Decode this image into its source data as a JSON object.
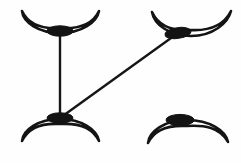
{
  "figure": {
    "canvas": {
      "width": 241,
      "height": 163
    },
    "background_color": "#fefefe",
    "outline_color": "#141414",
    "node_color": "#131313",
    "edge_color": "#161616",
    "outline_stroke_width": 2.6,
    "edge_stroke_width": 2.4
  },
  "shapes": [
    {
      "id": "top-left",
      "label": "crescent-top-left",
      "orientation": "opening-up",
      "bounds": {
        "x": 20,
        "y": 9,
        "width": 80,
        "height": 28
      },
      "path": "M 22 11 C 23 22 38 33 60 33 C 82 33 97 22 99 11 C 92 26 76 29 60 28 C 44 29 29 26 22 11 Z",
      "node": {
        "cx": 60,
        "cy": 31,
        "rx": 13,
        "ry": 5.2,
        "rotate": 0
      }
    },
    {
      "id": "top-right",
      "label": "crescent-top-right",
      "orientation": "opening-up",
      "bounds": {
        "x": 150,
        "y": 9,
        "width": 82,
        "height": 30
      },
      "path": "M 152 12 C 154 24 169 36 191 36 C 213 36 228 23 231 11 C 223 27 207 31 190 30 C 173 31 159 27 152 12 Z",
      "node": {
        "cx": 178,
        "cy": 33,
        "rx": 13,
        "ry": 5.4,
        "rotate": -8
      }
    },
    {
      "id": "bottom-left",
      "label": "crescent-bottom-left",
      "orientation": "opening-down",
      "bounds": {
        "x": 20,
        "y": 112,
        "width": 80,
        "height": 31
      },
      "path": "M 22 141 C 23 130 38 119 60 119 C 82 119 97 130 99 141 C 92 126 76 123 60 124 C 44 123 29 126 22 141 Z",
      "node": {
        "cx": 60,
        "cy": 118,
        "rx": 13,
        "ry": 5.2,
        "rotate": 0
      }
    },
    {
      "id": "bottom-right",
      "label": "crescent-bottom-right",
      "orientation": "opening-down",
      "bounds": {
        "x": 146,
        "y": 113,
        "width": 84,
        "height": 32
      },
      "path": "M 148 143 C 149 132 164 120 187 120 C 210 120 226 131 228 142 C 220 127 204 125 187 126 C 170 125 155 128 148 143 Z",
      "node": {
        "cx": 180,
        "cy": 120,
        "rx": 14,
        "ry": 5.6,
        "rotate": 0
      }
    }
  ],
  "edges": [
    {
      "id": "edge-vertical",
      "label": "edge-top-left-to-bottom-left",
      "from": "top-left",
      "to": "bottom-left",
      "x1": 60,
      "y1": 31,
      "x2": 60,
      "y2": 118
    },
    {
      "id": "edge-diagonal",
      "label": "edge-bottom-left-to-top-right",
      "from": "bottom-left",
      "to": "top-right",
      "x1": 60,
      "y1": 118,
      "x2": 178,
      "y2": 33
    }
  ]
}
